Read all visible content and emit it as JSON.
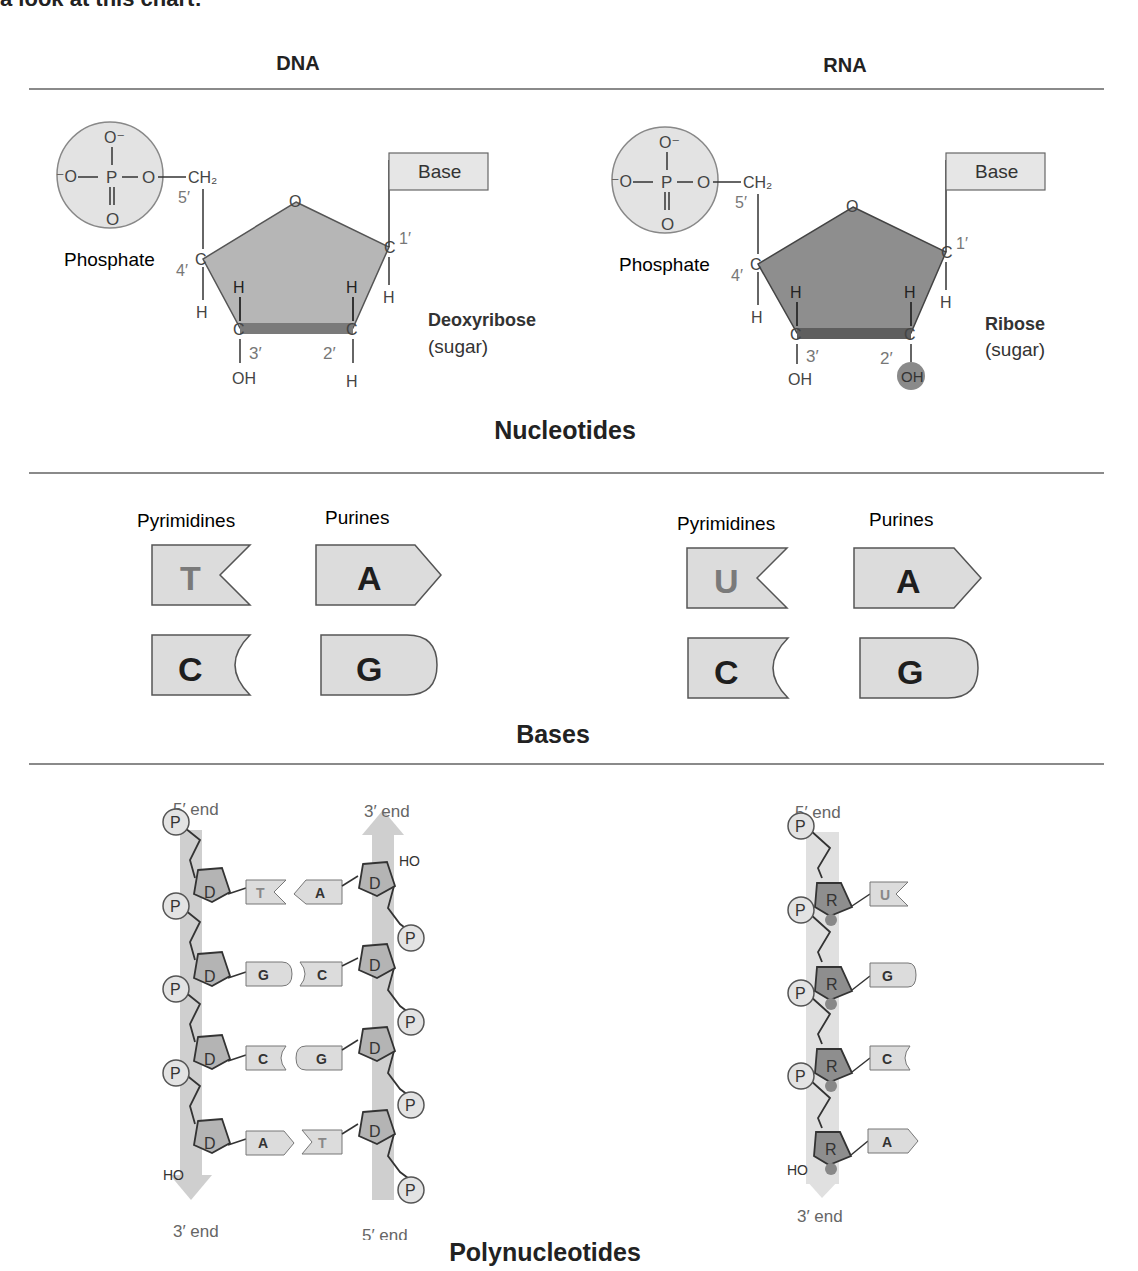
{
  "intro_text": "a look at this chart:",
  "columns": {
    "dna": "DNA",
    "rna": "RNA"
  },
  "sections": {
    "nucleotides": "Nucleotides",
    "bases": "Bases",
    "polynucleotides": "Polynucleotides"
  },
  "nucleotide": {
    "phosphate_label": "Phosphate",
    "base_label": "Base",
    "dna_sugar_name": "Deoxyribose",
    "rna_sugar_name": "Ribose",
    "sugar_note": "(sugar)",
    "atoms": {
      "O": "O",
      "O_minus": "O⁻",
      "minus_O": "⁻O",
      "P": "P",
      "CH2": "CH₂",
      "C": "C",
      "H": "H",
      "OH": "OH"
    },
    "carbon_labels": [
      "1′",
      "2′",
      "3′",
      "4′",
      "5′"
    ]
  },
  "bases": {
    "pyrimidines_label": "Pyrimidines",
    "purines_label": "Purines",
    "dna": {
      "pyrimidines": [
        "T",
        "C"
      ],
      "purines": [
        "A",
        "G"
      ]
    },
    "rna": {
      "pyrimidines": [
        "U",
        "C"
      ],
      "purines": [
        "A",
        "G"
      ]
    }
  },
  "polynucleotides": {
    "end_5": "5′ end",
    "end_3": "3′ end",
    "phosphate": "P",
    "deoxyribose": "D",
    "ribose": "R",
    "hydroxyl": "HO",
    "dna_left_strand": [
      "T",
      "G",
      "C",
      "A"
    ],
    "dna_right_strand": [
      "A",
      "C",
      "G",
      "T"
    ],
    "rna_strand": [
      "U",
      "G",
      "C",
      "A"
    ]
  },
  "colors": {
    "shape_fill": "#dcdcdc",
    "sugar_fill_dna": "#b4b4b4",
    "sugar_fill_rna": "#8e8e8e",
    "strand_arrow": "#cfcfcf",
    "outline": "#555555",
    "rule": "#8a8a8a"
  }
}
